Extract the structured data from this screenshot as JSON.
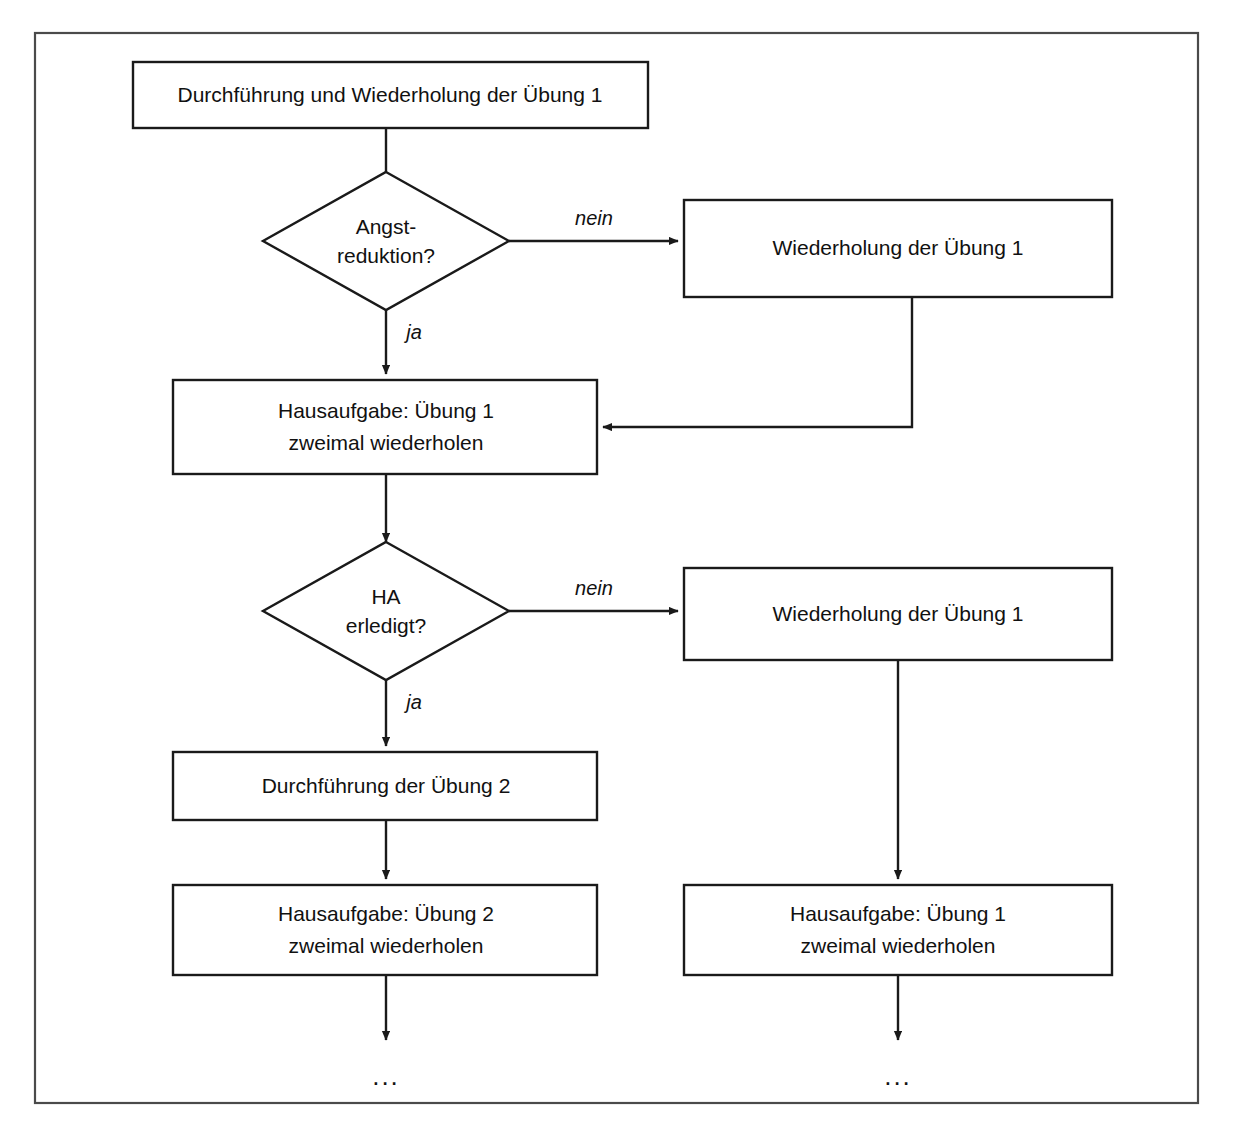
{
  "diagram": {
    "type": "flowchart",
    "title_visible": false,
    "language": "de",
    "colors": {
      "background": "#ffffff",
      "frame_stroke": "#4a4a4a",
      "node_stroke": "#1a1a1a",
      "node_fill": "#ffffff",
      "connector_stroke": "#1a1a1a",
      "text": "#111111"
    },
    "frame": {
      "x": 35,
      "y": 33,
      "width": 1163,
      "height": 1070
    },
    "nodes": [
      {
        "id": "n1",
        "shape": "process",
        "lines": [
          "Durchführung und Wiederholung der Übung 1"
        ],
        "x": 133,
        "y": 62,
        "width": 515,
        "height": 66
      },
      {
        "id": "d1",
        "shape": "decision",
        "lines": [
          "Angst-",
          "reduktion?"
        ],
        "cx": 386,
        "cy": 241,
        "rx": 123,
        "ry": 69
      },
      {
        "id": "n2",
        "shape": "process",
        "lines": [
          "Wiederholung der Übung 1"
        ],
        "x": 684,
        "y": 200,
        "width": 428,
        "height": 97
      },
      {
        "id": "n3",
        "shape": "process",
        "lines": [
          "Hausaufgabe: Übung 1",
          "zweimal wiederholen"
        ],
        "x": 173,
        "y": 380,
        "width": 424,
        "height": 94
      },
      {
        "id": "d2",
        "shape": "decision",
        "lines": [
          "HA",
          "erledigt?"
        ],
        "cx": 386,
        "cy": 611,
        "rx": 123,
        "ry": 69
      },
      {
        "id": "n4",
        "shape": "process",
        "lines": [
          "Wiederholung der Übung 1"
        ],
        "x": 684,
        "y": 568,
        "width": 428,
        "height": 92
      },
      {
        "id": "n5",
        "shape": "process",
        "lines": [
          "Durchführung der Übung 2"
        ],
        "x": 173,
        "y": 752,
        "width": 424,
        "height": 68
      },
      {
        "id": "n6",
        "shape": "process",
        "lines": [
          "Hausaufgabe: Übung 2",
          "zweimal wiederholen"
        ],
        "x": 173,
        "y": 885,
        "width": 424,
        "height": 90
      },
      {
        "id": "n7",
        "shape": "process",
        "lines": [
          "Hausaufgabe: Übung 1",
          "zweimal wiederholen"
        ],
        "x": 684,
        "y": 885,
        "width": 428,
        "height": 90
      }
    ],
    "edge_labels": {
      "nein_1": "nein",
      "ja_1": "ja",
      "nein_2": "nein",
      "ja_2": "ja"
    },
    "terminators": {
      "left_ellipsis": "...",
      "right_ellipsis": "..."
    },
    "edges": [
      {
        "from": "n1",
        "to": "d1",
        "label": ""
      },
      {
        "from": "d1",
        "to": "n2",
        "label": "nein"
      },
      {
        "from": "d1",
        "to": "n3",
        "label": "ja"
      },
      {
        "from": "n2",
        "to": "n3",
        "label": ""
      },
      {
        "from": "n3",
        "to": "d2",
        "label": ""
      },
      {
        "from": "d2",
        "to": "n4",
        "label": "nein"
      },
      {
        "from": "d2",
        "to": "n5",
        "label": "ja"
      },
      {
        "from": "n4",
        "to": "n7",
        "label": ""
      },
      {
        "from": "n5",
        "to": "n6",
        "label": ""
      },
      {
        "from": "n6",
        "to": "left_ellipsis",
        "label": ""
      },
      {
        "from": "n7",
        "to": "right_ellipsis",
        "label": ""
      }
    ]
  }
}
